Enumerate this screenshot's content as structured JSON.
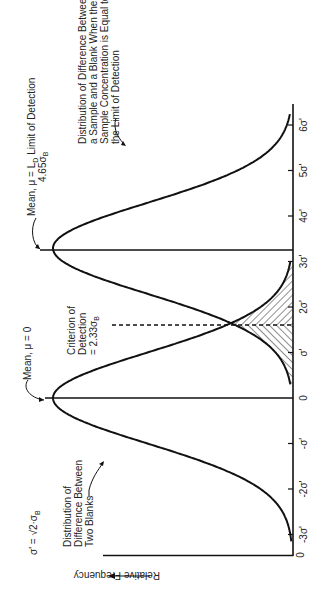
{
  "chart_data": {
    "type": "line",
    "orientation": "rotated-90-clockwise",
    "title": "",
    "xlabel": "",
    "ylabel": "Relative Frequency",
    "x_ticks": [
      "-3σ'",
      "-2σ'",
      "-σ'",
      "0",
      "σ'",
      "2σ'",
      "3σ'",
      "4σ'",
      "5σ'",
      "6σ'"
    ],
    "x_tick_values": [
      -3,
      -2,
      -1,
      0,
      1,
      2,
      3,
      4,
      5,
      6
    ],
    "y_origin_label": "0",
    "xlim": [
      -3.3,
      6.4
    ],
    "series": [
      {
        "name": "Distribution of Difference Between Two Blanks",
        "distribution": "normal",
        "mean": 0,
        "sd": 1,
        "x": [
          -3,
          -2,
          -1,
          0,
          1,
          1.65,
          2,
          3
        ],
        "values": [
          0.004,
          0.054,
          0.242,
          0.399,
          0.242,
          0.102,
          0.054,
          0.004
        ]
      },
      {
        "name": "Distribution of Difference Between a Sample and a Blank When the Sample Concentration Is Equal to the Limit of Detection",
        "distribution": "normal",
        "mean": 3.29,
        "sd": 1,
        "x": [
          0.3,
          1,
          1.65,
          2,
          3,
          3.29,
          4,
          5,
          6
        ],
        "values": [
          0.005,
          0.029,
          0.102,
          0.173,
          0.383,
          0.399,
          0.31,
          0.093,
          0.01
        ]
      }
    ],
    "reference_lines": [
      {
        "name": "Mean, μ = 0",
        "x": 0,
        "style": "solid"
      },
      {
        "name": "Mean, μ = L_D Limit of Detection 4.65σ_B",
        "x": 3.29,
        "style": "solid"
      },
      {
        "name": "Criterion of Detection = 2.33σ_B",
        "x": 1.65,
        "style": "dashed"
      }
    ],
    "shaded_region": {
      "description": "hatched overlap tails of both distributions between 0.3σ' and 3σ'",
      "from": 0.3,
      "to": 3.0
    },
    "annotations": [
      "σ' = √2·σ_B",
      "Distribution of Difference Between Two Blanks",
      "Mean, μ = 0",
      "Criterion of Detection = 2.33σ_B",
      "Mean, μ = L_D Limit of Detection 4.65σ_B",
      "Distribution of Difference Between a Sample and a Blank When the Sample Concentration Is Equal to the Limit of Detection"
    ],
    "grid": false,
    "legend": "none"
  },
  "labels": {
    "sigma_def": "σ' = √2·σ",
    "sigma_def_sub": "B",
    "blanks_dist": [
      "Distribution of",
      "Difference Between",
      "Two Blanks"
    ],
    "mean0": "Mean, μ = 0",
    "criterion": [
      "Criterion of",
      "Detection",
      "= 2.33σ"
    ],
    "criterion_sub": "B",
    "meanLD": "Mean, μ = L",
    "meanLD_sub": "D",
    "meanLD_tail": " Limit of Detection",
    "meanLD_line2": "4.65σ",
    "meanLD_line2_sub": "B",
    "sample_dist": [
      "Distribution of Difference Between",
      "a Sample and a Blank When the",
      "Sample Concentration is Equal to",
      "the Limit of Detection"
    ],
    "y_axis": "Relative Frequency",
    "origin": "0"
  }
}
